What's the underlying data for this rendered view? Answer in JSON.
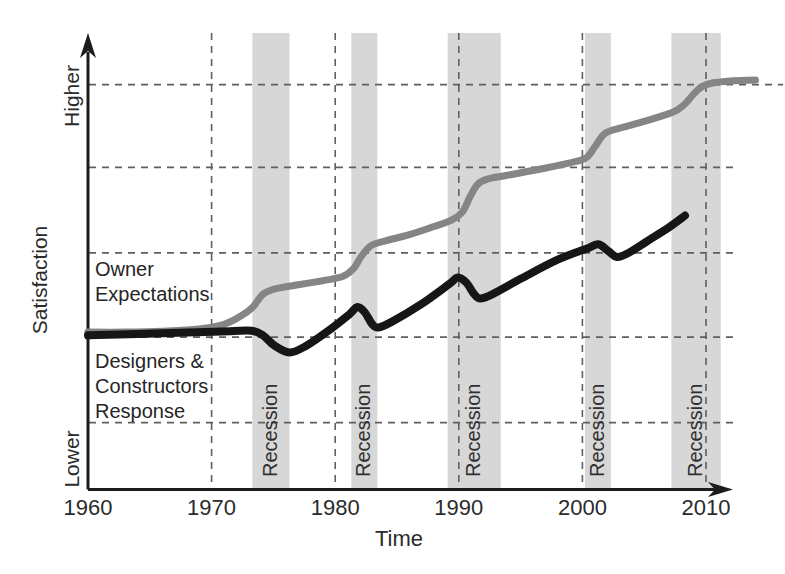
{
  "figure": {
    "xlabel": "Time",
    "ylabel": "Satisfaction",
    "y_top_label": "Higher",
    "y_bottom_label": "Lower",
    "curve_labels": {
      "owner": "Owner\nExpectations",
      "designers": "Designers &\nConstructors\nResponse"
    }
  },
  "chart_data": {
    "type": "line",
    "title": "",
    "xlabel": "Time",
    "ylabel": "Satisfaction",
    "y_axis_qualitative": [
      "Lower",
      "Higher"
    ],
    "x_ticks": [
      1960,
      1970,
      1980,
      1990,
      2000,
      2010
    ],
    "xlim": [
      1960,
      2014.5
    ],
    "ylim": [
      0,
      100
    ],
    "grid": "dashed",
    "grid_x_years": [
      1970,
      1980,
      1990,
      2000,
      2010
    ],
    "grid_y_values": [
      89,
      70.8,
      52,
      33.5,
      14.7
    ],
    "legend_position": "labels-inside-plot",
    "recession_label": "Recession",
    "recession_bands": [
      {
        "start": 1973.3,
        "end": 1976.3
      },
      {
        "start": 1981.3,
        "end": 1983.4
      },
      {
        "start": 1989.1,
        "end": 1993.4
      },
      {
        "start": 2000.2,
        "end": 2002.3
      },
      {
        "start": 2007.2,
        "end": 2011.2
      }
    ],
    "series": [
      {
        "name": "Owner Expectations",
        "color": "#858585",
        "stroke_width": 7,
        "points": [
          [
            1960,
            34.6
          ],
          [
            1963,
            34.6
          ],
          [
            1966,
            34.8
          ],
          [
            1969,
            35.3
          ],
          [
            1971,
            36.3
          ],
          [
            1972.3,
            38.0
          ],
          [
            1973.3,
            40.0
          ],
          [
            1974.2,
            43.0
          ],
          [
            1975.3,
            44.2
          ],
          [
            1977,
            45.0
          ],
          [
            1979,
            45.9
          ],
          [
            1980.6,
            46.8
          ],
          [
            1981.5,
            48.6
          ],
          [
            1982.1,
            51.2
          ],
          [
            1982.9,
            53.6
          ],
          [
            1984,
            54.6
          ],
          [
            1986,
            56.0
          ],
          [
            1988,
            57.8
          ],
          [
            1989.4,
            59.2
          ],
          [
            1990.3,
            61.0
          ],
          [
            1990.9,
            64.3
          ],
          [
            1991.5,
            67.0
          ],
          [
            1992.3,
            68.2
          ],
          [
            1993.6,
            68.9
          ],
          [
            1996,
            70.1
          ],
          [
            1999,
            71.8
          ],
          [
            2000.3,
            72.9
          ],
          [
            2001,
            75.3
          ],
          [
            2001.8,
            78.2
          ],
          [
            2003,
            79.4
          ],
          [
            2005,
            80.9
          ],
          [
            2007.3,
            82.9
          ],
          [
            2008.2,
            84.5
          ],
          [
            2009,
            86.9
          ],
          [
            2009.7,
            88.6
          ],
          [
            2010.6,
            89.4
          ],
          [
            2012,
            89.8
          ],
          [
            2014,
            90.0
          ]
        ]
      },
      {
        "name": "Designers & Constructors Response",
        "color": "#161616",
        "stroke_width": 8,
        "points": [
          [
            1960,
            33.9
          ],
          [
            1964,
            34.2
          ],
          [
            1968,
            34.5
          ],
          [
            1971.5,
            34.8
          ],
          [
            1973.2,
            34.9
          ],
          [
            1974.1,
            34.0
          ],
          [
            1975.1,
            31.6
          ],
          [
            1976.3,
            30.1
          ],
          [
            1977.6,
            31.5
          ],
          [
            1979.3,
            34.6
          ],
          [
            1981.1,
            38.4
          ],
          [
            1981.8,
            40.1
          ],
          [
            1982.4,
            38.9
          ],
          [
            1983,
            36.3
          ],
          [
            1983.5,
            35.6
          ],
          [
            1984.6,
            36.9
          ],
          [
            1987,
            40.8
          ],
          [
            1989.2,
            45.1
          ],
          [
            1989.9,
            46.6
          ],
          [
            1990.6,
            45.5
          ],
          [
            1991.2,
            43.1
          ],
          [
            1991.7,
            42.0
          ],
          [
            1992.7,
            42.9
          ],
          [
            1995,
            46.3
          ],
          [
            1998,
            50.5
          ],
          [
            2000.5,
            53.1
          ],
          [
            2001.3,
            53.9
          ],
          [
            2002.1,
            52.4
          ],
          [
            2002.8,
            51.1
          ],
          [
            2003.6,
            51.8
          ],
          [
            2005.2,
            54.5
          ],
          [
            2007,
            57.6
          ],
          [
            2008.3,
            60.2
          ]
        ]
      }
    ],
    "colors": {
      "band": "#d7d7d7",
      "grid": "#5f5f5f",
      "axis": "#1c1c1c",
      "text": "#2b2b2b"
    }
  }
}
